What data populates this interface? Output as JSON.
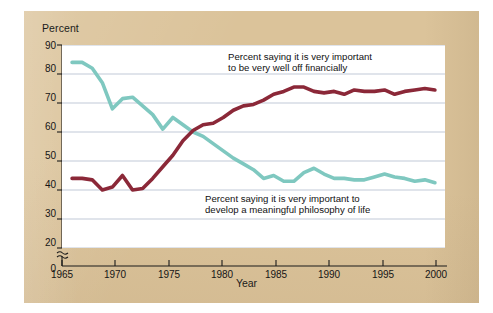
{
  "figure": {
    "panel_color": "#dbc39a",
    "plot_background": "#ffffff"
  },
  "axes": {
    "y_title": "Percent",
    "x_title": "Year",
    "y_ticks": [
      "0",
      "20",
      "30",
      "40",
      "50",
      "60",
      "70",
      "80",
      "90"
    ],
    "x_ticks": [
      "1965",
      "1970",
      "1975",
      "1980",
      "1985",
      "1990",
      "1995",
      "2000"
    ],
    "axis_break": true
  },
  "annotations": {
    "financial": {
      "line1": "Percent saying it is very important",
      "line2": "to be very well off financially"
    },
    "philosophy": {
      "line1": "Percent saying it is very important to",
      "line2": "develop a meaningful philosophy of life"
    }
  },
  "chart_data": {
    "type": "line",
    "title": "",
    "xlabel": "Year",
    "ylabel": "Percent",
    "xlim": [
      1965,
      2003
    ],
    "ylim": [
      20,
      90
    ],
    "y_axis_break_below": 20,
    "grid": "horizontal",
    "legend_position": "inline-annotations",
    "x": [
      1966,
      1967,
      1968,
      1969,
      1970,
      1971,
      1972,
      1973,
      1974,
      1975,
      1976,
      1977,
      1978,
      1979,
      1980,
      1981,
      1982,
      1983,
      1984,
      1985,
      1986,
      1987,
      1988,
      1989,
      1990,
      1991,
      1992,
      1993,
      1994,
      1995,
      1996,
      1997,
      1998,
      1999,
      2000,
      2001,
      2002
    ],
    "series": [
      {
        "name": "Percent saying it is very important to be very well off financially",
        "color": "#8b2838",
        "values": [
          44,
          44,
          43.5,
          40,
          41,
          45,
          40,
          40.5,
          44,
          48,
          52,
          57,
          60.5,
          62.5,
          63,
          65,
          67.5,
          69,
          69.5,
          71,
          73,
          74,
          75.5,
          75.5,
          74,
          73.5,
          74,
          73,
          74.5,
          74,
          74,
          74.5,
          73,
          74,
          74.5,
          75,
          74.5
        ]
      },
      {
        "name": "Percent saying it is very important to develop a meaningful philosophy of life",
        "color": "#7fc8c0",
        "values": [
          84,
          84,
          82,
          77,
          68,
          71.5,
          72,
          69,
          66,
          61,
          65,
          62.5,
          60,
          58.5,
          56,
          53.5,
          51,
          49,
          47,
          44,
          45,
          43,
          43,
          46,
          47.5,
          45.5,
          44,
          44,
          43.5,
          43.5,
          44.5,
          45.5,
          44.5,
          44,
          43,
          43.5,
          42.5
        ]
      }
    ]
  }
}
